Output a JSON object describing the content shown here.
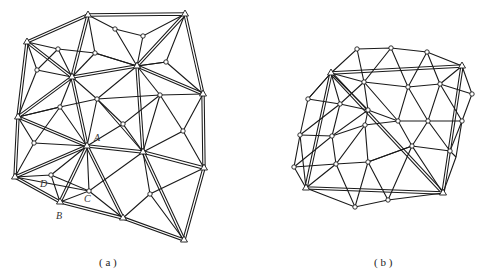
{
  "figures": [
    {
      "id": "a",
      "caption": "( a )",
      "point_labels": {
        "A": "A",
        "B": "B",
        "C": "C",
        "D": "D"
      }
    },
    {
      "id": "b",
      "caption": "( b )"
    }
  ],
  "colors": {
    "line": "#1a1a1a",
    "background": "#ffffff"
  }
}
